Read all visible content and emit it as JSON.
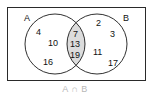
{
  "diagram": {
    "type": "venn",
    "sets": [
      {
        "label": "A",
        "only": [
          "4",
          "10",
          "16"
        ]
      },
      {
        "label": "B",
        "only": [
          "2",
          "3",
          "11",
          "17"
        ]
      }
    ],
    "intersection": [
      "7",
      "13",
      "19"
    ],
    "caption": "A ∩ B",
    "colors": {
      "frame": "#2a2a2a",
      "circle_stroke": "#1a1a1a",
      "intersection_fill": "#dcdcdc",
      "caption": "#b8b8b8",
      "text": "#111111"
    }
  }
}
